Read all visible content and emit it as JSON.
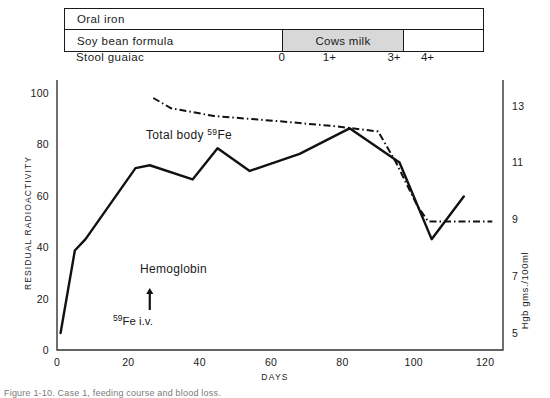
{
  "figure": {
    "caption": "Figure 1-10.  Case 1, feeding course and blood loss."
  },
  "timeline": {
    "rows": [
      {
        "name": "oral-iron",
        "label": "Oral iron",
        "segments": []
      },
      {
        "name": "feeding",
        "label": "Soy bean formula",
        "segments": [
          {
            "label": "Cows milk",
            "shaded": true,
            "start_pct": 52.0,
            "end_pct": 81.0
          },
          {
            "label": "",
            "shaded": false,
            "start_pct": 81.0,
            "end_pct": 100.0
          }
        ]
      }
    ]
  },
  "guaiac": {
    "label": "Stool guaiac",
    "marks": [
      {
        "value": "0",
        "x_pct": 49.5
      },
      {
        "value": "1+",
        "x_pct": 60.3
      },
      {
        "value": "3+",
        "x_pct": 75.0
      },
      {
        "value": "4+",
        "x_pct": 82.6
      }
    ]
  },
  "chart_data": {
    "type": "line",
    "title": "",
    "xlabel": "DAYS",
    "ylabel": "RESIDUAL  RADIOACTIVITY",
    "y2label": "Hgb  gms./100ml",
    "xlim": [
      0,
      125
    ],
    "ylim": [
      0,
      105
    ],
    "y2lim": [
      4.4,
      13.9
    ],
    "grid": false,
    "legend": "inline-labels",
    "xticks": [
      0,
      20,
      40,
      60,
      80,
      100,
      120
    ],
    "yticks": [
      0,
      20,
      40,
      60,
      80,
      100
    ],
    "y2ticks": [
      5,
      7,
      9,
      11,
      13
    ],
    "series": [
      {
        "name": "Total body 59Fe",
        "label_html": "Total body <sup>59</sup>Fe",
        "axis": "left",
        "style": "dash-dot",
        "points": [
          {
            "x": 27,
            "y": 98
          },
          {
            "x": 32,
            "y": 94
          },
          {
            "x": 44,
            "y": 91
          },
          {
            "x": 62,
            "y": 89
          },
          {
            "x": 78,
            "y": 87
          },
          {
            "x": 90,
            "y": 85
          },
          {
            "x": 95,
            "y": 73
          },
          {
            "x": 101,
            "y": 56
          },
          {
            "x": 104,
            "y": 50
          },
          {
            "x": 122,
            "y": 50
          }
        ]
      },
      {
        "name": "Hemoglobin",
        "label_html": "Hemoglobin",
        "axis": "right",
        "style": "solid",
        "points_hgb": [
          {
            "x": 1,
            "hgb": 5.0
          },
          {
            "x": 5,
            "hgb": 7.9
          },
          {
            "x": 8,
            "hgb": 8.3
          },
          {
            "x": 22,
            "hgb": 10.8
          },
          {
            "x": 26,
            "hgb": 10.9
          },
          {
            "x": 38,
            "hgb": 10.4
          },
          {
            "x": 45,
            "hgb": 11.5
          },
          {
            "x": 54,
            "hgb": 10.7
          },
          {
            "x": 68,
            "hgb": 11.3
          },
          {
            "x": 82,
            "hgb": 12.2
          },
          {
            "x": 96,
            "hgb": 11.0
          },
          {
            "x": 105,
            "hgb": 8.3
          },
          {
            "x": 114,
            "hgb": 9.8
          }
        ]
      }
    ],
    "annotations": [
      {
        "name": "fe59-iv-arrow",
        "label_html": "<sup>59</sup>Fe i.v.",
        "x": 26,
        "arrow_from_y_px": 310,
        "arrow_to_y_px": 288
      }
    ]
  }
}
